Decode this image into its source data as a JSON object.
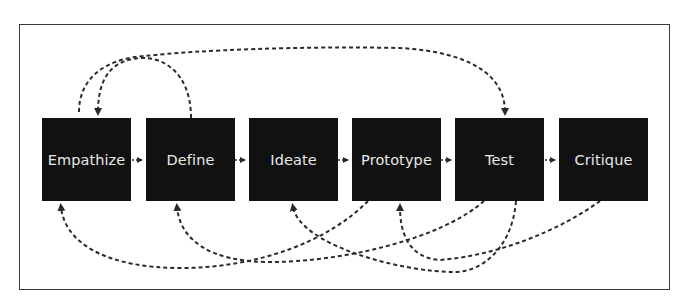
{
  "diagram": {
    "type": "design-thinking-process",
    "colors": {
      "box_fill": "#111111",
      "box_text": "#e8e8e8",
      "connector": "#2a2a2a",
      "frame": "#3a3a3a"
    },
    "stages": [
      {
        "id": "empathize",
        "label": "Empathize"
      },
      {
        "id": "define",
        "label": "Define"
      },
      {
        "id": "ideate",
        "label": "Ideate"
      },
      {
        "id": "prototype",
        "label": "Prototype"
      },
      {
        "id": "test",
        "label": "Test"
      },
      {
        "id": "critique",
        "label": "Critique"
      }
    ],
    "forward_connectors": [
      {
        "from": "Empathize",
        "to": "Define"
      },
      {
        "from": "Define",
        "to": "Ideate"
      },
      {
        "from": "Ideate",
        "to": "Prototype"
      },
      {
        "from": "Prototype",
        "to": "Test"
      },
      {
        "from": "Test",
        "to": "Critique"
      }
    ],
    "feedback_loops_top": [
      {
        "from": "Define",
        "to": "Empathize"
      },
      {
        "from": "Empathize",
        "to": "Test"
      }
    ],
    "feedback_loops_bottom": [
      {
        "from": "Prototype",
        "to": "Empathize"
      },
      {
        "from": "Test",
        "to": "Define"
      },
      {
        "from": "Test",
        "to": "Ideate"
      },
      {
        "from": "Critique",
        "to": "Prototype"
      }
    ]
  }
}
